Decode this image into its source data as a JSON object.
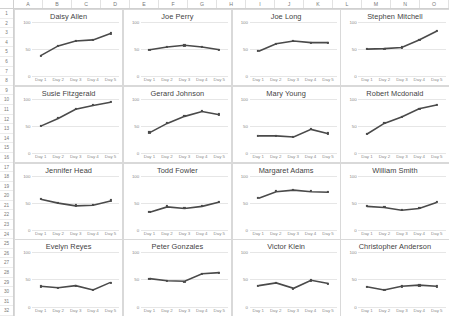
{
  "spreadsheet": {
    "column_headers": [
      "A",
      "B",
      "C",
      "D",
      "E",
      "F",
      "G",
      "H",
      "I",
      "J",
      "K",
      "L",
      "M",
      "N",
      "O"
    ],
    "row_headers": [
      "1",
      "2",
      "3",
      "4",
      "5",
      "6",
      "7",
      "8",
      "9",
      "10",
      "11",
      "12",
      "13",
      "14",
      "15",
      "16",
      "17",
      "18",
      "19",
      "20",
      "21",
      "22",
      "23",
      "24",
      "25",
      "26",
      "27",
      "28",
      "29",
      "30",
      "31",
      "32"
    ],
    "corner_label": ""
  },
  "chart_data": [
    {
      "type": "line",
      "title": "Daisy Allen",
      "categories": [
        "Day 1",
        "Day 2",
        "Day 3",
        "Day 4",
        "Day 5"
      ],
      "values": [
        38,
        56,
        65,
        67,
        79
      ],
      "xlabel": "",
      "ylabel": "",
      "ylim": [
        0,
        100
      ],
      "yticks": [
        0,
        50,
        100
      ],
      "grid": true,
      "legend": "none"
    },
    {
      "type": "line",
      "title": "Joe Perry",
      "categories": [
        "Day 1",
        "Day 2",
        "Day 3",
        "Day 4",
        "Day 5"
      ],
      "values": [
        49,
        54,
        57,
        54,
        49
      ],
      "xlabel": "",
      "ylabel": "",
      "ylim": [
        0,
        100
      ],
      "yticks": [
        0,
        50,
        100
      ],
      "grid": true,
      "legend": "none"
    },
    {
      "type": "line",
      "title": "Joe Long",
      "categories": [
        "Day 1",
        "Day 2",
        "Day 3",
        "Day 4",
        "Day 5"
      ],
      "values": [
        46,
        60,
        65,
        62,
        62
      ],
      "xlabel": "",
      "ylabel": "",
      "ylim": [
        0,
        100
      ],
      "yticks": [
        0,
        50,
        100
      ],
      "grid": true,
      "legend": "none"
    },
    {
      "type": "line",
      "title": "Stephen Mitchell",
      "categories": [
        "Day 1",
        "Day 2",
        "Day 3",
        "Day 4",
        "Day 5"
      ],
      "values": [
        50,
        51,
        53,
        67,
        83
      ],
      "xlabel": "",
      "ylabel": "",
      "ylim": [
        0,
        100
      ],
      "yticks": [
        0,
        50,
        100
      ],
      "grid": true,
      "legend": "none"
    },
    {
      "type": "line",
      "title": "Susie Fitzgerald",
      "categories": [
        "Day 1",
        "Day 2",
        "Day 3",
        "Day 4",
        "Day 5"
      ],
      "values": [
        50,
        64,
        81,
        88,
        94
      ],
      "xlabel": "",
      "ylabel": "",
      "ylim": [
        0,
        100
      ],
      "yticks": [
        0,
        50,
        100
      ],
      "grid": true,
      "legend": "none"
    },
    {
      "type": "line",
      "title": "Gerard Johnson",
      "categories": [
        "Day 1",
        "Day 2",
        "Day 3",
        "Day 4",
        "Day 5"
      ],
      "values": [
        38,
        55,
        68,
        77,
        71
      ],
      "xlabel": "",
      "ylabel": "",
      "ylim": [
        0,
        100
      ],
      "yticks": [
        0,
        50,
        100
      ],
      "grid": true,
      "legend": "none"
    },
    {
      "type": "line",
      "title": "Mary Young",
      "categories": [
        "Day 1",
        "Day 2",
        "Day 3",
        "Day 4",
        "Day 5"
      ],
      "values": [
        32,
        32,
        30,
        44,
        36
      ],
      "xlabel": "",
      "ylabel": "",
      "ylim": [
        0,
        100
      ],
      "yticks": [
        0,
        50,
        100
      ],
      "grid": true,
      "legend": "none"
    },
    {
      "type": "line",
      "title": "Robert Mcdonald",
      "categories": [
        "Day 1",
        "Day 2",
        "Day 3",
        "Day 4",
        "Day 5"
      ],
      "values": [
        35,
        55,
        67,
        82,
        89
      ],
      "xlabel": "",
      "ylabel": "",
      "ylim": [
        0,
        100
      ],
      "yticks": [
        0,
        50,
        100
      ],
      "grid": true,
      "legend": "none"
    },
    {
      "type": "line",
      "title": "Jennifer Head",
      "categories": [
        "Day 1",
        "Day 2",
        "Day 3",
        "Day 4",
        "Day 5"
      ],
      "values": [
        57,
        50,
        45,
        46,
        54
      ],
      "xlabel": "",
      "ylabel": "",
      "ylim": [
        0,
        100
      ],
      "yticks": [
        0,
        50,
        100
      ],
      "grid": true,
      "legend": "none"
    },
    {
      "type": "line",
      "title": "Todd Fowler",
      "categories": [
        "Day 1",
        "Day 2",
        "Day 3",
        "Day 4",
        "Day 5"
      ],
      "values": [
        33,
        43,
        40,
        44,
        52
      ],
      "xlabel": "",
      "ylabel": "",
      "ylim": [
        0,
        100
      ],
      "yticks": [
        0,
        50,
        100
      ],
      "grid": true,
      "legend": "none"
    },
    {
      "type": "line",
      "title": "Margaret Adams",
      "categories": [
        "Day 1",
        "Day 2",
        "Day 3",
        "Day 4",
        "Day 5"
      ],
      "values": [
        59,
        71,
        74,
        71,
        70
      ],
      "xlabel": "",
      "ylabel": "",
      "ylim": [
        0,
        100
      ],
      "yticks": [
        0,
        50,
        100
      ],
      "grid": true,
      "legend": "none"
    },
    {
      "type": "line",
      "title": "William Smith",
      "categories": [
        "Day 1",
        "Day 2",
        "Day 3",
        "Day 4",
        "Day 5"
      ],
      "values": [
        44,
        42,
        37,
        40,
        51
      ],
      "xlabel": "",
      "ylabel": "",
      "ylim": [
        0,
        100
      ],
      "yticks": [
        0,
        50,
        100
      ],
      "grid": true,
      "legend": "none"
    },
    {
      "type": "line",
      "title": "Evelyn Reyes",
      "categories": [
        "Day 1",
        "Day 2",
        "Day 3",
        "Day 4",
        "Day 5"
      ],
      "values": [
        37,
        34,
        38,
        30,
        44
      ],
      "xlabel": "",
      "ylabel": "",
      "ylim": [
        0,
        100
      ],
      "yticks": [
        0,
        50,
        100
      ],
      "grid": true,
      "legend": "none"
    },
    {
      "type": "line",
      "title": "Peter Gonzales",
      "categories": [
        "Day 1",
        "Day 2",
        "Day 3",
        "Day 4",
        "Day 5"
      ],
      "values": [
        51,
        47,
        46,
        60,
        62
      ],
      "xlabel": "",
      "ylabel": "",
      "ylim": [
        0,
        100
      ],
      "yticks": [
        0,
        50,
        100
      ],
      "grid": true,
      "legend": "none"
    },
    {
      "type": "line",
      "title": "Victor Klein",
      "categories": [
        "Day 1",
        "Day 2",
        "Day 3",
        "Day 4",
        "Day 5"
      ],
      "values": [
        38,
        43,
        33,
        48,
        42
      ],
      "xlabel": "",
      "ylabel": "",
      "ylim": [
        0,
        100
      ],
      "yticks": [
        0,
        50,
        100
      ],
      "grid": true,
      "legend": "none"
    },
    {
      "type": "line",
      "title": "Christopher Anderson",
      "categories": [
        "Day 1",
        "Day 2",
        "Day 3",
        "Day 4",
        "Day 5"
      ],
      "values": [
        36,
        30,
        37,
        39,
        37
      ],
      "xlabel": "",
      "ylabel": "",
      "ylim": [
        0,
        100
      ],
      "yticks": [
        0,
        50,
        100
      ],
      "grid": true,
      "legend": "none"
    }
  ]
}
